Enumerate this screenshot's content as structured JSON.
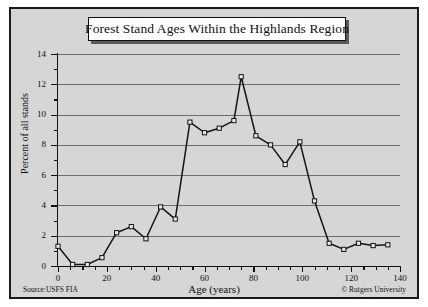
{
  "chart_data": {
    "type": "line",
    "title": "Forest Stand Ages Within the Highlands Region",
    "xlabel": "Age (years)",
    "ylabel": "Percent of all stands",
    "xlim": [
      0,
      140
    ],
    "ylim": [
      0,
      14
    ],
    "xticks": [
      0,
      20,
      40,
      60,
      80,
      100,
      120,
      140
    ],
    "yticks": [
      0,
      2,
      4,
      6,
      8,
      10,
      12,
      14
    ],
    "xtick_minor_step": 5,
    "ytick_minor_step": 1,
    "grid": "horizontal",
    "legend": "none",
    "marker": "open-square",
    "line_color": "#141414",
    "plot_background": "#d6d6d6",
    "grid_color": "#6e6e6e",
    "series": [
      {
        "name": "Percent of all stands",
        "x": [
          0,
          6,
          12,
          18,
          24,
          30,
          36,
          42,
          48,
          54,
          60,
          66,
          72,
          75,
          81,
          87,
          93,
          99,
          105,
          111,
          117,
          123,
          129,
          135
        ],
        "values": [
          1.3,
          0.1,
          0.1,
          0.55,
          2.2,
          2.6,
          1.8,
          3.9,
          3.1,
          9.5,
          8.8,
          9.1,
          9.6,
          12.5,
          8.6,
          8.0,
          6.7,
          8.2,
          4.3,
          1.5,
          1.1,
          1.5,
          1.35,
          1.4
        ]
      }
    ],
    "source_note": "Source:USFS FIA",
    "copyright_note": "© Rutgers University"
  },
  "figure": {
    "title": "Forest Stand Ages Within the Highlands Region",
    "xlabel": "Age (years)",
    "ylabel": "Percent of all stands",
    "source_note": "Source:USFS FIA",
    "copyright_note": "© Rutgers University"
  }
}
